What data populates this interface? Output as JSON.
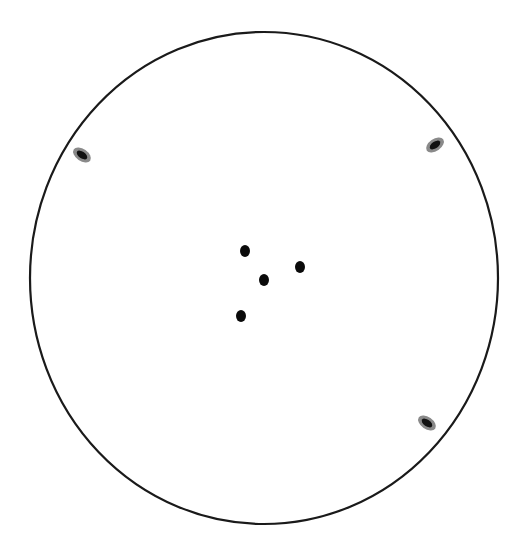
{
  "canvas": {
    "width": 521,
    "height": 547,
    "background": "#ffffff"
  },
  "outline": {
    "cx": 264,
    "cy": 278,
    "rx": 234,
    "ry": 246,
    "stroke": "#1a1a1a",
    "stroke_width": 2.2
  },
  "marks": [
    {
      "cx": 82,
      "cy": 155,
      "rx": 10,
      "ry": 6,
      "rotate": 35,
      "halo": "#8a8a8a",
      "core": "#111111"
    },
    {
      "cx": 435,
      "cy": 145,
      "rx": 10,
      "ry": 6,
      "rotate": -35,
      "halo": "#8a8a8a",
      "core": "#111111"
    },
    {
      "cx": 427,
      "cy": 423,
      "rx": 10,
      "ry": 6,
      "rotate": 35,
      "halo": "#8a8a8a",
      "core": "#111111"
    }
  ],
  "dots": [
    {
      "cx": 245,
      "cy": 251,
      "rx": 5,
      "ry": 6,
      "fill": "#0a0a0a"
    },
    {
      "cx": 300,
      "cy": 267,
      "rx": 5,
      "ry": 6,
      "fill": "#0a0a0a"
    },
    {
      "cx": 264,
      "cy": 280,
      "rx": 5,
      "ry": 6,
      "fill": "#0a0a0a"
    },
    {
      "cx": 241,
      "cy": 316,
      "rx": 5,
      "ry": 6,
      "fill": "#0a0a0a"
    }
  ]
}
